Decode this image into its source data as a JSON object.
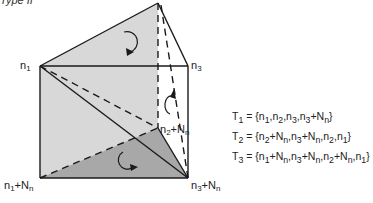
{
  "caption": "Type II",
  "nodes": {
    "n1": "n1",
    "n3": "n3",
    "n2_Nn": "n2+Nn",
    "n1_Nn": "n1+Nn",
    "n3_Nn": "n3+Nn"
  },
  "sets": [
    {
      "name": "T1",
      "value": "{n1,n2,n3,n3+Nn}"
    },
    {
      "name": "T2",
      "value": "{n2+Nn,n3+Nn,n2,n1}"
    },
    {
      "name": "T3",
      "value": "{n1+Nn,n3+Nn,n2+Nn,n1}"
    }
  ],
  "colors": {
    "light_fill": "#d6d6d6",
    "dark_fill": "#a9a9a9",
    "line": "#1a1a1a"
  }
}
